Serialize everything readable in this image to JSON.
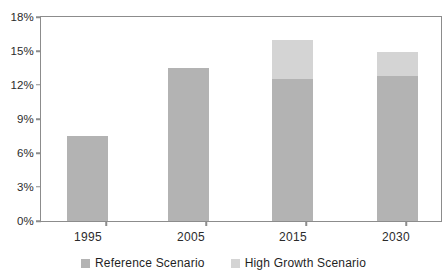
{
  "chart_data": {
    "type": "bar",
    "title": "",
    "subtitle": "",
    "xlabel": "",
    "ylabel": "",
    "categories": [
      "1995",
      "2005",
      "2015",
      "2030"
    ],
    "series": [
      {
        "name": "Reference Scenario",
        "color": "#b3b3b3",
        "values": [
          7.5,
          13.5,
          12.5,
          12.8
        ]
      },
      {
        "name": "High Growth Scenario",
        "color": "#d4d4d4",
        "values": [
          0,
          0,
          3.5,
          2.1
        ]
      }
    ],
    "stacked": true,
    "totals": [
      7.5,
      13.5,
      16.0,
      14.9
    ],
    "ylim": [
      0,
      18
    ],
    "yticks": [
      0,
      3,
      6,
      9,
      12,
      15,
      18
    ],
    "ytick_labels": [
      "0%",
      "3%",
      "6%",
      "9%",
      "12%",
      "15%",
      "18%"
    ],
    "grid": false,
    "legend_position": "bottom"
  },
  "axes": {
    "y": {
      "ticks": [
        {
          "label": "18%",
          "value": 18
        },
        {
          "label": "15%",
          "value": 15
        },
        {
          "label": "12%",
          "value": 12
        },
        {
          "label": "9%",
          "value": 9
        },
        {
          "label": "6%",
          "value": 6
        },
        {
          "label": "3%",
          "value": 3
        },
        {
          "label": "0%",
          "value": 0
        }
      ]
    },
    "x": {
      "ticks": [
        {
          "label": "1995"
        },
        {
          "label": "2005"
        },
        {
          "label": "2015"
        },
        {
          "label": "2030"
        }
      ]
    }
  },
  "legend": {
    "items": [
      {
        "label": "Reference Scenario",
        "color": "#b3b3b3"
      },
      {
        "label": "High Growth Scenario",
        "color": "#d4d4d4"
      }
    ]
  },
  "colors": {
    "reference": "#b3b3b3",
    "high_growth": "#d4d4d4",
    "axis": "#8c8c8c",
    "text": "#2b2b2b",
    "background": "#ffffff"
  }
}
